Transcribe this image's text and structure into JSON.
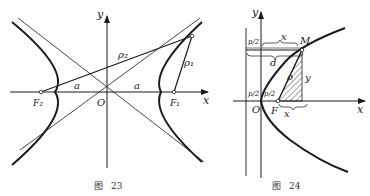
{
  "figures": [
    {
      "id": "fig23",
      "caption": "图 23",
      "caption_char": "图",
      "caption_num": "23",
      "subject": "hyperbola with foci and asymptotes",
      "labels": {
        "x_axis": "x",
        "y_axis": "y",
        "origin": "O",
        "focus_left": "F₂",
        "focus_right": "F₁",
        "semi_axis_left": "a",
        "semi_axis_right": "a",
        "radius_1": "ρ₁",
        "radius_2": "ρ₂"
      }
    },
    {
      "id": "fig24",
      "caption": "图 24",
      "caption_char": "图",
      "caption_num": "24",
      "subject": "parabola with focus, directrix and point M",
      "labels": {
        "x_axis": "x",
        "y_axis": "y",
        "origin": "O",
        "focus": "F",
        "point": "M",
        "half_p_top": "p/2",
        "half_p_left": "p/2",
        "half_p_mid": "p/2",
        "x_top": "x",
        "x_bottom": "x",
        "d": "d",
        "rho": "ρ",
        "y_side": "y"
      }
    }
  ],
  "colors": {
    "ink": "#1a1a1a",
    "paper": "#ffffff"
  }
}
